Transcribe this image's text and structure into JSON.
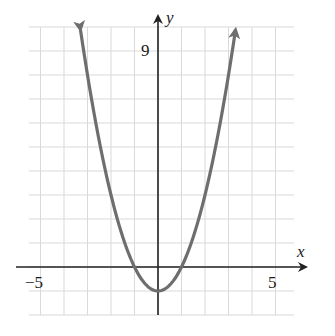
{
  "chart_data": {
    "type": "line",
    "title": "",
    "function": "y = x^2 - 1",
    "xlabel": "x",
    "ylabel": "y",
    "xlim": [
      -5.5,
      5.8
    ],
    "ylim": [
      -2,
      10
    ],
    "grid": true,
    "tick_labels": {
      "x_left": "−5",
      "x_right": "5",
      "y_top": "9"
    },
    "series": [
      {
        "name": "y = x^2 - 1",
        "x": [
          -3.3,
          -3,
          -2,
          -1,
          0,
          1,
          2,
          3,
          3.3
        ],
        "y": [
          9.89,
          8,
          3,
          0,
          -1,
          0,
          3,
          8,
          9.89
        ]
      }
    ],
    "key_points": {
      "vertex": [
        0,
        -1
      ],
      "x_intercepts": [
        -1,
        1
      ]
    },
    "colors": {
      "curve": "#6e6e6e",
      "axis": "#222222",
      "grid": "#d8d8d8"
    }
  }
}
